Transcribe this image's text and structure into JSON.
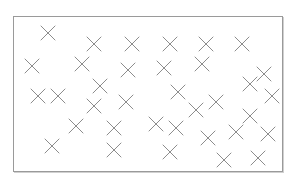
{
  "diagram": {
    "frame": {
      "x": 13,
      "y": 16,
      "width": 270,
      "height": 156,
      "stroke": "#9a9a9a"
    },
    "marker": {
      "type": "cross-icon",
      "size": 14,
      "stroke": "#8c8c8c",
      "stroke_width": 1
    },
    "points": [
      {
        "x": 48,
        "y": 33
      },
      {
        "x": 94,
        "y": 44
      },
      {
        "x": 132,
        "y": 44
      },
      {
        "x": 170,
        "y": 44
      },
      {
        "x": 206,
        "y": 44
      },
      {
        "x": 242,
        "y": 44
      },
      {
        "x": 32,
        "y": 66
      },
      {
        "x": 82,
        "y": 64
      },
      {
        "x": 128,
        "y": 70
      },
      {
        "x": 164,
        "y": 68
      },
      {
        "x": 202,
        "y": 64
      },
      {
        "x": 264,
        "y": 74
      },
      {
        "x": 250,
        "y": 84
      },
      {
        "x": 100,
        "y": 86
      },
      {
        "x": 38,
        "y": 96
      },
      {
        "x": 58,
        "y": 96
      },
      {
        "x": 178,
        "y": 92
      },
      {
        "x": 272,
        "y": 96
      },
      {
        "x": 94,
        "y": 106
      },
      {
        "x": 126,
        "y": 102
      },
      {
        "x": 216,
        "y": 102
      },
      {
        "x": 196,
        "y": 110
      },
      {
        "x": 250,
        "y": 116
      },
      {
        "x": 76,
        "y": 126
      },
      {
        "x": 114,
        "y": 128
      },
      {
        "x": 156,
        "y": 124
      },
      {
        "x": 176,
        "y": 128
      },
      {
        "x": 236,
        "y": 132
      },
      {
        "x": 268,
        "y": 134
      },
      {
        "x": 208,
        "y": 138
      },
      {
        "x": 52,
        "y": 146
      },
      {
        "x": 114,
        "y": 150
      },
      {
        "x": 170,
        "y": 152
      },
      {
        "x": 224,
        "y": 160
      },
      {
        "x": 258,
        "y": 158
      }
    ]
  }
}
